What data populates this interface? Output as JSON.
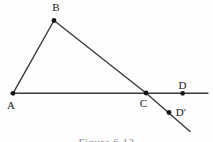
{
  "figure": {
    "caption": "Figure 6.12"
  },
  "diagram": {
    "style": {
      "line_color": "#3a3a3a",
      "line_width": 1.4,
      "dot_color": "#141414",
      "dot_radius": 2.4,
      "background": "#fefefe"
    },
    "lines": [
      {
        "name": "horizontal-base-line",
        "x1": 11,
        "y1": 93.3,
        "x2": 208,
        "y2": 93.3
      },
      {
        "name": "segment-AB",
        "x1": 13,
        "y1": 93.3,
        "x2": 54,
        "y2": 20.5
      },
      {
        "name": "segment-BC",
        "x1": 54,
        "y1": 20.5,
        "x2": 146,
        "y2": 93.0
      },
      {
        "name": "extension-beyond-C",
        "x1": 146,
        "y1": 93.0,
        "x2": 190,
        "y2": 131.5
      }
    ],
    "points": [
      {
        "id": "A",
        "label": "A",
        "x": 13,
        "y": 93.3,
        "label_x": 11,
        "label_y": 109
      },
      {
        "id": "B",
        "label": "B",
        "x": 54,
        "y": 20.5,
        "label_x": 56,
        "label_y": 11
      },
      {
        "id": "C",
        "label": "C",
        "x": 146,
        "y": 93.0,
        "label_x": 143.5,
        "label_y": 107
      },
      {
        "id": "D",
        "label": "D",
        "x": 182.7,
        "y": 93.3,
        "label_x": 182.5,
        "label_y": 88.5
      },
      {
        "id": "D-prime",
        "label": "D′",
        "x": 169,
        "y": 112.5,
        "label_x": 181,
        "label_y": 115.5
      }
    ]
  }
}
